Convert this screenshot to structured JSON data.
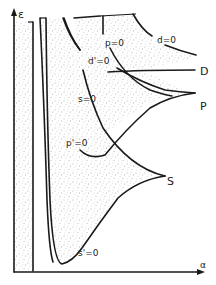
{
  "axes": {
    "y_label": "ε",
    "x_label": "α"
  },
  "curve_labels": {
    "s0_upper": "s=0",
    "d_prime0": "d'=0",
    "p0": "p=0",
    "d0": "d=0",
    "p_prime0": "p'=0",
    "s_prime0": "s'=0"
  },
  "region_labels": {
    "D": "D",
    "P": "P",
    "S": "S"
  },
  "colors": {
    "ink": "#1a1a1a",
    "paper": "#ffffff",
    "stipple": "#6a6a6a"
  }
}
